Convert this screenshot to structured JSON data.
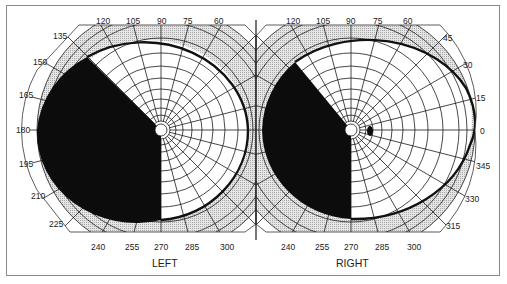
{
  "figure": {
    "type": "visual-field-perimetry-chart",
    "colors": {
      "frame": "#8a8a8a",
      "scotoma": "#0c0c0c",
      "band": "#d8d8d8",
      "grid": "#1a1a1a",
      "isopter": "#111111"
    }
  },
  "left_eye": {
    "label": "LEFT",
    "ticks": {
      "t120": "120",
      "t105": "105",
      "t90": "90",
      "t75": "75",
      "t60": "60",
      "t135": "135",
      "t150": "150",
      "t165": "165",
      "t180": "180",
      "t195": "195",
      "t210": "210",
      "t225": "225",
      "t240": "240",
      "t255": "255",
      "t270": "270",
      "t285": "285",
      "t300": "300"
    },
    "defect": "dense scotoma from approx. 135° through 180° to 270° (left hemifield)"
  },
  "right_eye": {
    "label": "RIGHT",
    "ticks": {
      "t120": "120",
      "t105": "105",
      "t90": "90",
      "t75": "75",
      "t60": "60",
      "t45": "45",
      "t30": "30",
      "t15": "15",
      "t0": "0",
      "t345": "345",
      "t330": "330",
      "t315": "315",
      "t240": "240",
      "t255": "255",
      "t270": "270",
      "t285": "285",
      "t300": "300"
    },
    "defect": "dense scotoma from approx. 125° through 180° to 270° (left hemifield); physiological blind spot temporal at ~0°"
  }
}
